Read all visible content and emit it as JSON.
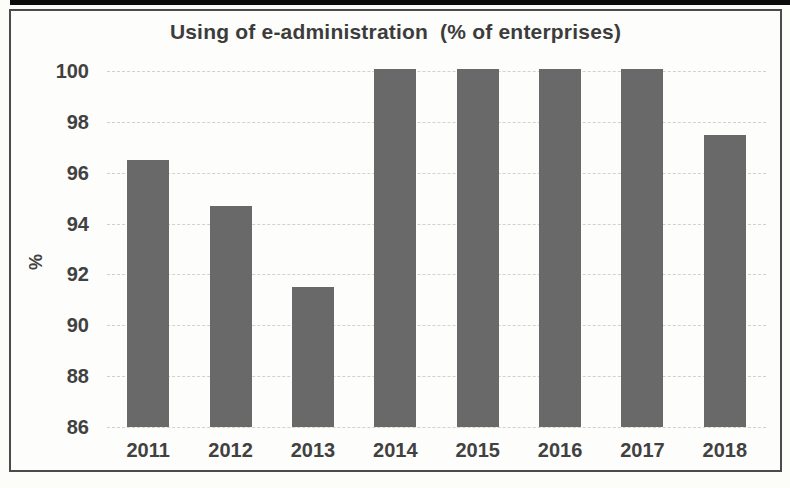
{
  "chart": {
    "title": "Using of e-administration  (% of enterprises)",
    "y_axis_label": "%",
    "colors": {
      "bar": "#696969",
      "grid": "#d2d1cc",
      "text": "#414141",
      "frame_border": "#4b4b4b",
      "top_strip": "#0c0c0c",
      "paper": "#fcfcf9"
    }
  },
  "chart_data": {
    "type": "bar",
    "title": "Using of e-administration (% of enterprises)",
    "categories": [
      "2011",
      "2012",
      "2013",
      "2014",
      "2015",
      "2016",
      "2017",
      "2018"
    ],
    "values": [
      96.5,
      94.7,
      91.5,
      100,
      100,
      100,
      100,
      97.5
    ],
    "xlabel": "",
    "ylabel": "%",
    "ylim": [
      86,
      100
    ],
    "yticks": [
      86,
      88,
      90,
      92,
      94,
      96,
      98,
      100
    ],
    "grid": true,
    "legend": false,
    "legend_position": "none",
    "bar_color": "#696969"
  }
}
